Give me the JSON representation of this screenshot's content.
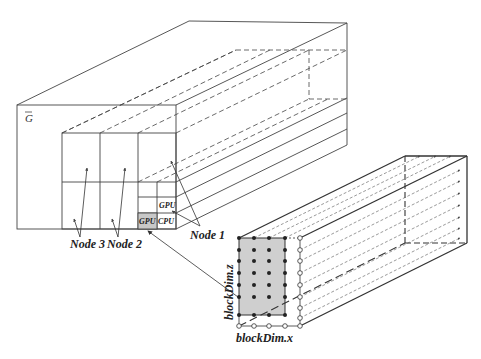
{
  "diagram": {
    "grid_label": "G",
    "nodes": [
      {
        "label": "Node 1"
      },
      {
        "label": "Node 2"
      },
      {
        "label": "Node 3"
      }
    ],
    "cells": {
      "top_right": "GPU",
      "bottom_left": "GPU",
      "bottom_right": "CPU"
    },
    "block": {
      "x_label": "blockDim.x",
      "z_label": "blockDim.z"
    },
    "colors": {
      "line": "#333333",
      "shade": "#cccccc",
      "background": "#ffffff"
    }
  }
}
